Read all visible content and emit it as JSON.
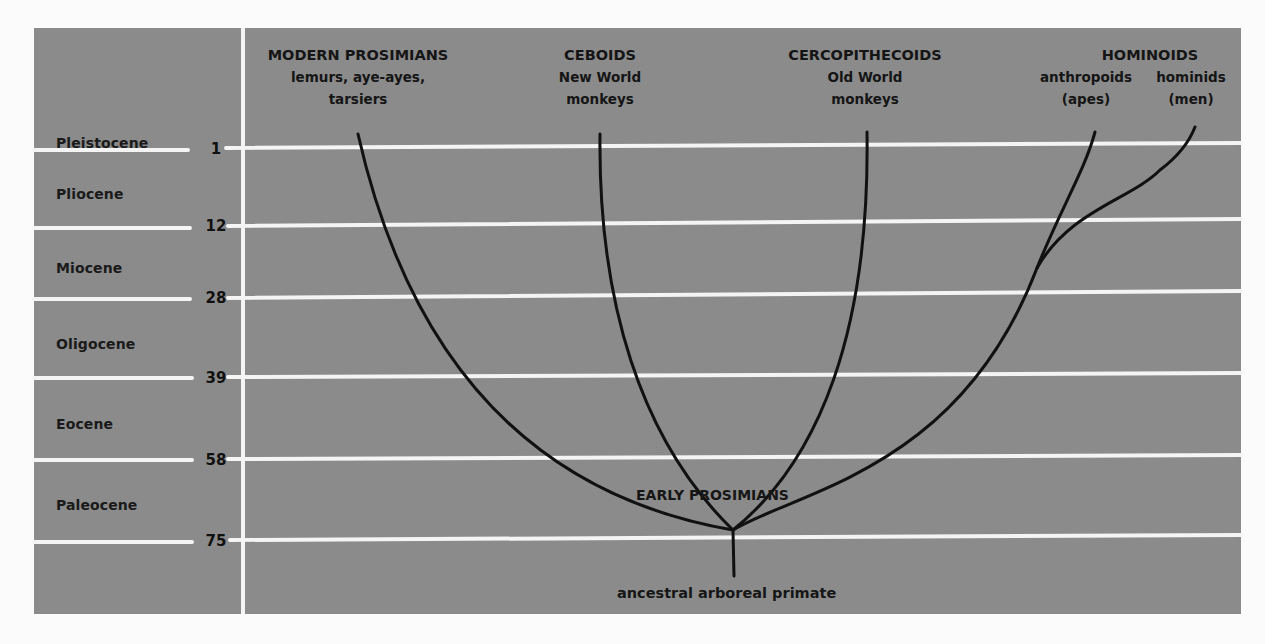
{
  "diagram": {
    "colors": {
      "panel": "#8b8b8b",
      "grid_line": "#f4f4f4",
      "branch": "#111111",
      "text": "#151515",
      "page": "#fbfbfb"
    },
    "epochs": [
      {
        "name": "Pleistocene",
        "label_y": 143
      },
      {
        "name": "Pliocene",
        "label_y": 194
      },
      {
        "name": "Miocene",
        "label_y": 268
      },
      {
        "name": "Oligocene",
        "label_y": 343
      },
      {
        "name": "Eocene",
        "label_y": 425
      },
      {
        "name": "Paleocene",
        "label_y": 505
      }
    ],
    "boundaries_mya": [
      {
        "value": "1",
        "y": 148
      },
      {
        "value": "12",
        "y": 226
      },
      {
        "value": "28",
        "y": 298
      },
      {
        "value": "39",
        "y": 378
      },
      {
        "value": "58",
        "y": 460
      },
      {
        "value": "75",
        "y": 541
      }
    ],
    "groups": [
      {
        "head": "MODERN PROSIMIANS",
        "line1": "lemurs, aye-ayes,",
        "line2": "tarsiers"
      },
      {
        "head": "CEBOIDS",
        "line1": "New World",
        "line2": "monkeys"
      },
      {
        "head": "CERCOPITHECOIDS",
        "line1": "Old World",
        "line2": "monkeys"
      },
      {
        "head": "HOMINOIDS",
        "sub_left": "anthropoids",
        "sub_left_2": "(apes)",
        "sub_right": "hominids",
        "sub_right_2": "(men)"
      }
    ],
    "root_label": "ancestral arboreal primate",
    "node_label": "EARLY PROSIMIANS"
  }
}
